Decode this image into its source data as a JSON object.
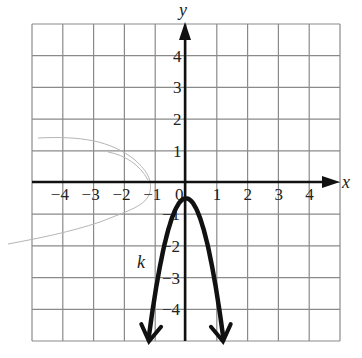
{
  "chart_data": {
    "type": "line",
    "title": "",
    "xlabel": "x",
    "ylabel": "y",
    "xlim": [
      -5,
      5
    ],
    "ylim": [
      -5,
      5
    ],
    "grid": true,
    "x_ticks": [
      "−4",
      "−3",
      "−2",
      "−1",
      "0",
      "1",
      "2",
      "3",
      "4"
    ],
    "y_ticks": [
      "4",
      "3",
      "2",
      "1",
      "−1",
      "−2",
      "−3",
      "−4"
    ],
    "series": [
      {
        "name": "k",
        "equation_estimate": "k(x) = -3x^2 - 0.5",
        "vertex": [
          0,
          -0.5
        ],
        "x": [
          -1.2,
          -1.0,
          -0.8,
          -0.6,
          -0.4,
          -0.2,
          0,
          0.2,
          0.4,
          0.6,
          0.8,
          1.0,
          1.2
        ],
        "y": [
          -4.82,
          -3.5,
          -2.42,
          -1.58,
          -0.98,
          -0.62,
          -0.5,
          -0.62,
          -0.98,
          -1.58,
          -2.42,
          -3.5,
          -4.82
        ],
        "arrows_at_ends": true,
        "color": "#111111"
      }
    ],
    "annotations": [
      {
        "text": "k",
        "x": -1.45,
        "y": -2.6
      }
    ]
  },
  "labels": {
    "x_axis": "x",
    "y_axis": "y",
    "curve": "k",
    "origin": "0"
  }
}
